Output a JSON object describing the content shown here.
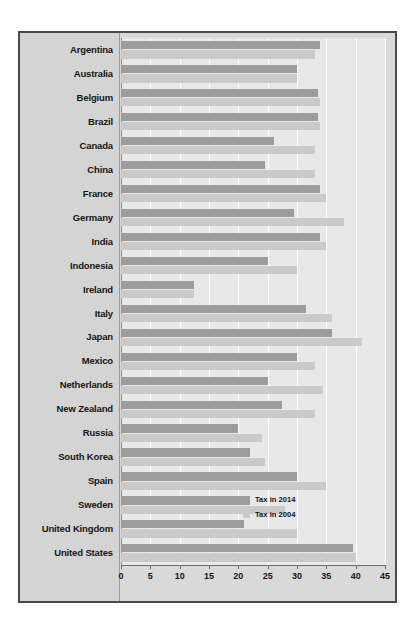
{
  "chart_data": {
    "type": "bar",
    "orientation": "horizontal",
    "title": "",
    "xlabel": "",
    "ylabel": "",
    "xlim": [
      0,
      45
    ],
    "xticks": [
      0,
      5,
      10,
      15,
      20,
      25,
      30,
      35,
      40,
      45
    ],
    "xticklabels": [
      "0",
      "5",
      "10",
      "15",
      "20",
      "25",
      "30",
      "35",
      "40",
      "45"
    ],
    "grid": true,
    "legend_position": "inside-right",
    "colors": {
      "tax_2014": "#9c9c9c",
      "tax_2004": "#cacaca",
      "panel_background": "#e8e8e8",
      "figure_background": "#d9d9d9",
      "label_background": "#d4d4d4",
      "border": "#4a4a4a",
      "gridline": "#ffffff",
      "axis": "#6e6e6e",
      "text": "#141414"
    },
    "categories": [
      "Argentina",
      "Australia",
      "Belgium",
      "Brazil",
      "Canada",
      "China",
      "France",
      "Germany",
      "India",
      "Indonesia",
      "Ireland",
      "Italy",
      "Japan",
      "Mexico",
      "Netherlands",
      "New Zealand",
      "Russia",
      "South Korea",
      "Spain",
      "Sweden",
      "United Kingdom",
      "United States"
    ],
    "series": [
      {
        "name": "Tax in 2014",
        "color": "#9c9c9c",
        "values": [
          34.0,
          30.0,
          33.5,
          33.5,
          26.0,
          24.5,
          34.0,
          29.5,
          34.0,
          25.0,
          12.5,
          31.5,
          36.0,
          30.0,
          25.0,
          27.5,
          20.0,
          22.0,
          30.0,
          22.0,
          21.0,
          39.5
        ]
      },
      {
        "name": "Tax in 2004",
        "color": "#cacaca",
        "values": [
          33.0,
          30.0,
          34.0,
          34.0,
          33.0,
          33.0,
          35.0,
          38.0,
          35.0,
          30.0,
          12.5,
          36.0,
          41.0,
          33.0,
          34.5,
          33.0,
          24.0,
          24.5,
          35.0,
          28.0,
          30.0,
          40.0
        ]
      }
    ]
  },
  "legend": {
    "items": [
      {
        "label": "Tax in 2014",
        "swatch": "tax-2014-swatch"
      },
      {
        "label": "Tax in 2004",
        "swatch": "tax-2004-swatch"
      }
    ]
  }
}
